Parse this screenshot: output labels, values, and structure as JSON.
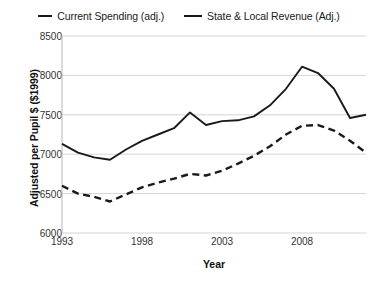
{
  "chart_data": {
    "type": "line",
    "title": "",
    "xlabel": "Year",
    "ylabel": "Adjusted per Pupil $ ($1999)",
    "xlim": [
      1993,
      2012
    ],
    "ylim": [
      6000,
      8500
    ],
    "y_ticks": [
      6000,
      6500,
      7000,
      7500,
      8000,
      8500
    ],
    "x_ticks": [
      1993,
      1998,
      2003,
      2008
    ],
    "x_tick_labels": [
      "1993",
      "1998",
      "2003",
      "2008"
    ],
    "y_tick_labels": [
      "6000",
      "6500",
      "7000",
      "7500",
      "8000",
      "8500"
    ],
    "grid": "horizontal",
    "legend_position": "top",
    "x": [
      1993,
      1994,
      1995,
      1996,
      1997,
      1998,
      1999,
      2000,
      2001,
      2002,
      2003,
      2004,
      2005,
      2006,
      2007,
      2008,
      2009,
      2010,
      2011,
      2012
    ],
    "series": [
      {
        "name": "Current Spending (adj.)",
        "style": "solid",
        "color": "#1a1a1a",
        "values": [
          7130,
          7020,
          6960,
          6930,
          7060,
          7170,
          7250,
          7330,
          7530,
          7370,
          7420,
          7430,
          7480,
          7620,
          7830,
          8110,
          8030,
          7830,
          7460,
          7500
        ]
      },
      {
        "name": "State & Local Revenue (Adj.)",
        "style": "dashed",
        "color": "#1a1a1a",
        "values": [
          6600,
          6500,
          6460,
          6400,
          6490,
          6580,
          6640,
          6690,
          6750,
          6730,
          6790,
          6880,
          6980,
          7100,
          7250,
          7360,
          7370,
          7300,
          7170,
          7020
        ]
      }
    ]
  },
  "legend": {
    "items": [
      {
        "label": "Current Spending (adj.)",
        "marker": "solid-line-marker"
      },
      {
        "label": "State & Local Revenue (Adj.)",
        "marker": "solid-line-marker"
      }
    ]
  },
  "axes": {
    "y_title": "Adjusted per Pupil $ ($1999)",
    "x_title": "Year"
  }
}
